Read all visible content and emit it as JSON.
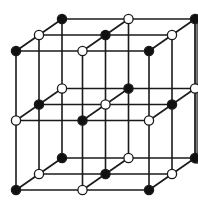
{
  "diagram": {
    "title": "",
    "type": "crystal-lattice",
    "colors": {
      "line": "#1a1a1a",
      "filled": "#111111",
      "open": "#ffffff"
    },
    "grid": {
      "size": 3,
      "origin": [
        16,
        51
      ],
      "step_x": 66.5,
      "step_y": 69.5,
      "depth_dx": 23,
      "depth_dy": -16
    }
  }
}
